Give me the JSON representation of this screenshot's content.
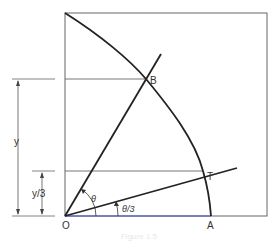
{
  "diagram": {
    "type": "geometry",
    "points": {
      "O": {
        "label": "O",
        "x": 65,
        "y": 216
      },
      "A": {
        "label": "A",
        "x": 211,
        "y": 216
      },
      "B": {
        "label": "B",
        "x": 146,
        "y": 79
      },
      "T": {
        "label": "T",
        "x": 203,
        "y": 171
      }
    },
    "angles": {
      "theta": {
        "label": "θ"
      },
      "theta_third": {
        "label": "θ/3"
      }
    },
    "dimensions": {
      "y": {
        "label": "y"
      },
      "y_third": {
        "label": "y/3"
      }
    },
    "colors": {
      "stroke": "#222222",
      "thin": "#555555",
      "baseline": "#3a4fc0"
    }
  },
  "caption": "Figure 1.5"
}
